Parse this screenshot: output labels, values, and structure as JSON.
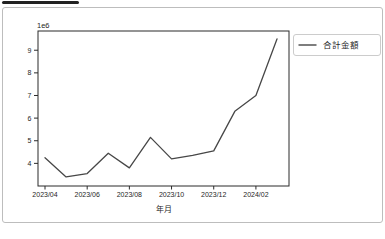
{
  "page": {
    "background": "#ffffff"
  },
  "top_bar": {
    "color": "#222222"
  },
  "card": {
    "border_color": "#bdbdbd",
    "background": "#ffffff"
  },
  "chart_data": {
    "type": "line",
    "title": "",
    "xlabel": "年月",
    "ylabel": "",
    "offset_text": "1e6",
    "unit_multiplier_note": "y values are in units of 1e6",
    "x": [
      "2023/04",
      "2023/05",
      "2023/06",
      "2023/07",
      "2023/08",
      "2023/09",
      "2023/10",
      "2023/11",
      "2023/12",
      "2024/01",
      "2024/02",
      "2024/03"
    ],
    "values": [
      4.25,
      3.4,
      3.55,
      4.45,
      3.8,
      5.15,
      4.2,
      4.35,
      4.55,
      6.3,
      7.0,
      9.5
    ],
    "yticks": [
      4,
      5,
      6,
      7,
      8,
      9
    ],
    "xtick_labels": [
      "2023/04",
      "2023/06",
      "2023/08",
      "2023/10",
      "2023/12",
      "2024/02"
    ],
    "xtick_indices": [
      0,
      2,
      4,
      6,
      8,
      10
    ],
    "ylim": [
      3.0,
      9.85
    ],
    "grid": false,
    "line_color": "#474747",
    "axis_color": "#2b2b2b",
    "legend": {
      "position": "right-outside",
      "border_color": "#cccccc",
      "entries": [
        {
          "label": "合計金額",
          "color": "#474747"
        }
      ]
    }
  }
}
